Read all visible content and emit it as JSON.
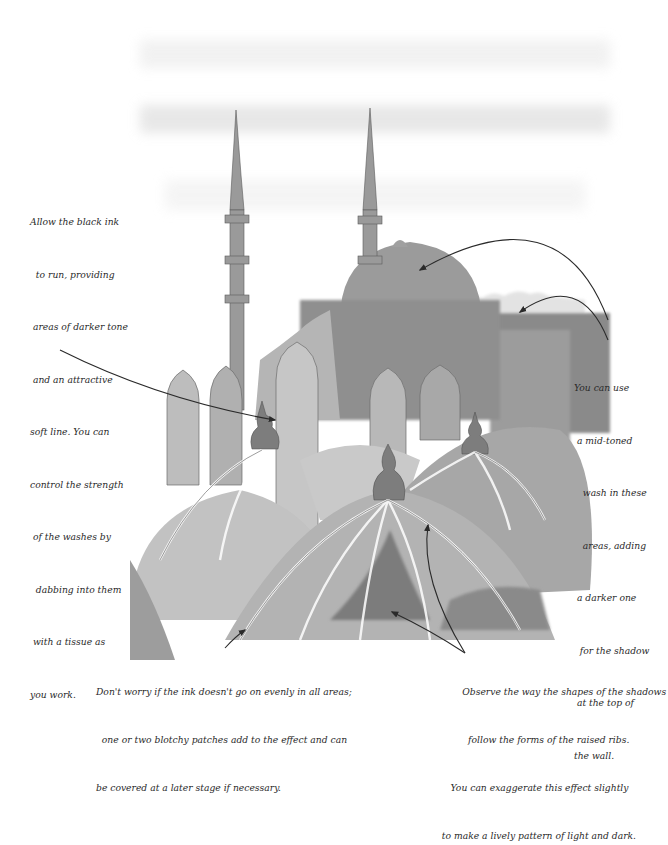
{
  "illustration": {
    "subject": "Mosque with minarets and domes, ink wash sketch",
    "palette": {
      "paper": "#ffffff",
      "wash_light": "#d9d9d9",
      "wash_mid": "#a9a9a9",
      "wash_dark": "#6e6e6e",
      "ink": "#2a2a2a"
    }
  },
  "annotations": {
    "left": {
      "lines": [
        "Allow the black ink",
        "  to run, providing",
        " areas of darker tone",
        " and an attractive",
        "soft line. You can",
        "control the strength",
        " of the washes by",
        "  dabbing into them",
        " with a tissue as",
        "you work."
      ]
    },
    "right": {
      "lines": [
        "You can use",
        " a mid-toned",
        "   wash in these",
        "   areas, adding",
        " a darker one",
        "  for the shadow",
        " at the top of",
        "the wall."
      ]
    },
    "bottom_left": {
      "lines": [
        "Don't worry if the ink doesn't go on evenly in all areas;",
        "  one or two blotchy patches add to the effect and can",
        "be covered at a later stage if necessary."
      ]
    },
    "bottom_right": {
      "lines": [
        "         Observe the way the shapes of the shadows",
        "           follow the forms of the raised ribs.",
        "     You can exaggerate this effect slightly",
        "  to make a lively pattern of light and dark."
      ]
    }
  }
}
